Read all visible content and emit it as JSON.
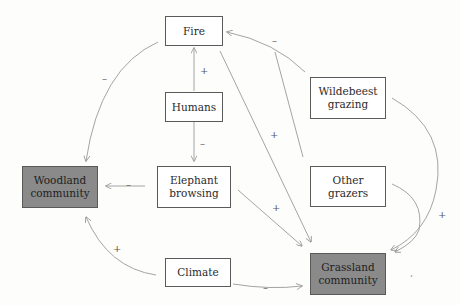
{
  "nodes": {
    "fire": {
      "label": "Fire"
    },
    "humans": {
      "label": "Humans"
    },
    "wildebeest": {
      "label": "Wildebeest grazing"
    },
    "woodland": {
      "label": "Woodland community"
    },
    "elephant": {
      "label": "Elephant browsing"
    },
    "other_grazers": {
      "label": "Other grazers"
    },
    "climate": {
      "label": "Climate"
    },
    "grassland": {
      "label": "Grassland community"
    }
  },
  "edges": [
    {
      "from": "Humans",
      "to": "Fire",
      "sign": "+"
    },
    {
      "from": "Humans",
      "to": "Elephant browsing",
      "sign": "–"
    },
    {
      "from": "Fire",
      "to": "Woodland community",
      "sign": "–"
    },
    {
      "from": "Fire",
      "to": "Grassland community",
      "sign": "+"
    },
    {
      "from": "Wildebeest grazing",
      "to": "Fire",
      "sign": "–"
    },
    {
      "from": "Other grazers",
      "to": "Fire",
      "sign": "–"
    },
    {
      "from": "Wildebeest grazing",
      "to": "Grassland community",
      "sign": "+"
    },
    {
      "from": "Other grazers",
      "to": "Grassland community",
      "sign": "+"
    },
    {
      "from": "Elephant browsing",
      "to": "Woodland community",
      "sign": "–"
    },
    {
      "from": "Elephant browsing",
      "to": "Grassland community",
      "sign": "+"
    },
    {
      "from": "Climate",
      "to": "Woodland community",
      "sign": "+"
    },
    {
      "from": "Climate",
      "to": "Grassland community",
      "sign": "–"
    }
  ],
  "signs": {
    "humans_fire": "+",
    "humans_elephant": "–",
    "fire_woodland": "–",
    "fire_grassland": "+",
    "grazers_fire": "–",
    "grazers_grassland": "+",
    "elephant_woodland": "–",
    "elephant_grassland": "+",
    "climate_woodland": "+",
    "climate_grassland": "–"
  },
  "colors": {
    "community_fill": "#8a8a8a",
    "box_fill": "#ffffff",
    "line": "#9a9a9a"
  }
}
